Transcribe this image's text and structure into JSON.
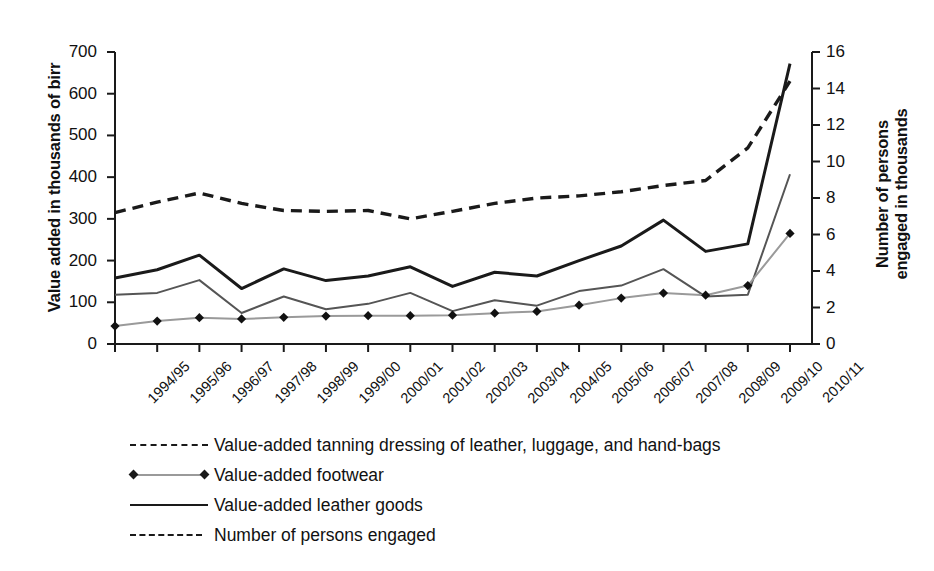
{
  "chart_data": {
    "type": "line",
    "title": "",
    "xlabel": "",
    "ylabel": "Value added in thousands of birr",
    "y2label": "Number of persons engaged in thousands",
    "ylim": [
      0,
      700
    ],
    "y2lim": [
      0,
      16
    ],
    "yticks": [
      0,
      100,
      200,
      300,
      400,
      500,
      600,
      700
    ],
    "y2ticks": [
      0,
      2,
      4,
      6,
      8,
      10,
      12,
      14,
      16
    ],
    "grid": false,
    "legend_position": "bottom-left",
    "categories": [
      "1994/95",
      "1995/96",
      "1996/97",
      "1997/98",
      "1998/99",
      "1999/00",
      "2000/01",
      "2001/02",
      "2002/03",
      "2003/04",
      "2004/05",
      "2005/06",
      "2006/07",
      "2007/08",
      "2008/09",
      "2009/10",
      "2010/11"
    ],
    "series": [
      {
        "name": "Value-added tanning dressing of leather, luggage, and hand-bags",
        "axis": "left",
        "style": "dashed-wide",
        "color": "#1a1a1a",
        "values": [
          315,
          340,
          362,
          337,
          320,
          318,
          320,
          300,
          318,
          337,
          350,
          355,
          365,
          380,
          392,
          470,
          630
        ]
      },
      {
        "name": "Value-added leather goods",
        "axis": "left",
        "style": "solid",
        "color": "#1a1a1a",
        "values": [
          158,
          178,
          213,
          133,
          180,
          152,
          163,
          185,
          138,
          172,
          163,
          200,
          235,
          297,
          222,
          240,
          672
        ]
      },
      {
        "name": "Number of persons engaged",
        "axis": "right",
        "style": "solid-thin",
        "color": "#555555",
        "values": [
          2.7,
          2.8,
          3.5,
          1.7,
          2.6,
          1.9,
          2.2,
          2.8,
          1.8,
          2.4,
          2.1,
          2.9,
          3.2,
          4.1,
          2.6,
          2.7,
          9.3
        ]
      },
      {
        "name": "Value-added footwear",
        "axis": "left",
        "style": "marker-line",
        "color": "#9a9a9a",
        "marker": "diamond",
        "values": [
          43,
          55,
          63,
          60,
          64,
          67,
          68,
          68,
          69,
          74,
          78,
          93,
          110,
          122,
          117,
          140,
          265
        ]
      }
    ]
  },
  "axes": {
    "left_title": "Value added in thousands of birr",
    "right_title_line1": "Number of persons",
    "right_title_line2": "engaged in thousands"
  },
  "legend": {
    "items": [
      {
        "key": "dashed-wide",
        "label": "Value-added tanning dressing of leather, luggage, and hand-bags"
      },
      {
        "key": "marker-line",
        "label": "Value-added footwear"
      },
      {
        "key": "solid",
        "label": "Value-added leather goods"
      },
      {
        "key": "dashed-small",
        "label": "Number of persons engaged"
      }
    ]
  }
}
